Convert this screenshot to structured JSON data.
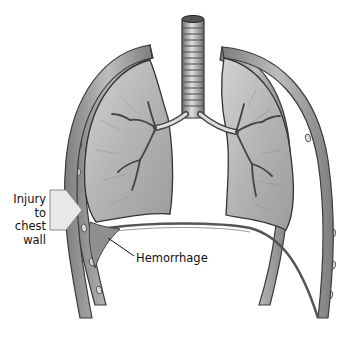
{
  "figure": {
    "labels": {
      "injury_line1": "Injury",
      "injury_line2": "to",
      "injury_line3": "chest",
      "injury_line4": "wall",
      "hemorrhage": "Hemorrhage"
    },
    "colors": {
      "lung_fill": "#bdbdbd",
      "lung_dark": "#8a8a8a",
      "wall": "#9a9a9a",
      "outline": "#3a3a3a",
      "hemorrhage": "#8f8f8f",
      "arrow": "#e6e6e6"
    }
  }
}
